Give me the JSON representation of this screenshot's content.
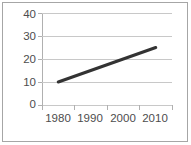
{
  "chart_data": {
    "type": "line",
    "title": "",
    "subtitle": "",
    "xlabel": "",
    "ylabel": "",
    "categories": [
      "1980",
      "1990",
      "2000",
      "2010"
    ],
    "x": [
      1980,
      1990,
      2000,
      2010
    ],
    "series": [
      {
        "name": "series-1",
        "values": [
          10,
          15,
          20,
          25
        ],
        "color": "#333333",
        "line_width": 3
      }
    ],
    "y_ticks": [
      "0",
      "10",
      "20",
      "30",
      "40"
    ],
    "y_tick_values": [
      0,
      10,
      20,
      30,
      40
    ],
    "ylim": [
      0,
      40
    ],
    "x_tick_labels": [
      "1980",
      "1990",
      "2000",
      "2010"
    ],
    "grid": true,
    "grid_axis": "y",
    "legend": false,
    "legend_position": "none",
    "annotations": []
  },
  "colors": {
    "frame_border": "#a6a6a6",
    "gridline": "#c8c8c8",
    "axis_line": "#b0b0b0",
    "tick_label": "#4d4d4d",
    "data_line": "#333333",
    "background": "#ffffff"
  }
}
